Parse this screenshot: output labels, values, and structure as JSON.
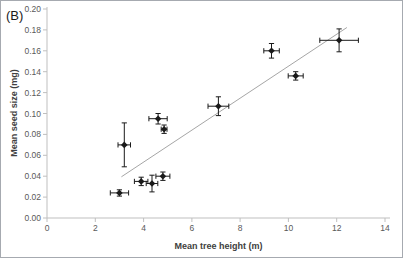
{
  "panel_label": "(B)",
  "chart_data": {
    "type": "scatter",
    "title": "",
    "xlabel": "Mean tree height (m)",
    "ylabel": "Mean seed size (mg)",
    "xlim": [
      0,
      14
    ],
    "ylim": [
      0,
      0.2
    ],
    "grid": false,
    "legend": "none",
    "marker": "filled-diamond",
    "xticks": [
      {
        "v": 0,
        "label": "0"
      },
      {
        "v": 2,
        "label": "2"
      },
      {
        "v": 4,
        "label": "4"
      },
      {
        "v": 6,
        "label": "6"
      },
      {
        "v": 8,
        "label": "8"
      },
      {
        "v": 10,
        "label": "10"
      },
      {
        "v": 12,
        "label": "12"
      },
      {
        "v": 14,
        "label": "14"
      }
    ],
    "yticks": [
      {
        "v": 0.0,
        "label": "0.00"
      },
      {
        "v": 0.02,
        "label": "0.02"
      },
      {
        "v": 0.04,
        "label": "0.04"
      },
      {
        "v": 0.06,
        "label": "0.06"
      },
      {
        "v": 0.08,
        "label": "0.08"
      },
      {
        "v": 0.1,
        "label": "0.10"
      },
      {
        "v": 0.12,
        "label": "0.12"
      },
      {
        "v": 0.14,
        "label": "0.14"
      },
      {
        "v": 0.16,
        "label": "0.16"
      },
      {
        "v": 0.18,
        "label": "0.18"
      },
      {
        "v": 0.2,
        "label": "0.20"
      }
    ],
    "points": [
      {
        "x": 3.0,
        "y": 0.024,
        "xerr": 0.38,
        "yerr": 0.003
      },
      {
        "x": 3.2,
        "y": 0.07,
        "xerr": 0.26,
        "yerr": 0.021
      },
      {
        "x": 3.9,
        "y": 0.035,
        "xerr": 0.28,
        "yerr": 0.004
      },
      {
        "x": 4.35,
        "y": 0.033,
        "xerr": 0.24,
        "yerr": 0.008
      },
      {
        "x": 4.6,
        "y": 0.095,
        "xerr": 0.38,
        "yerr": 0.005
      },
      {
        "x": 4.8,
        "y": 0.04,
        "xerr": 0.29,
        "yerr": 0.004
      },
      {
        "x": 4.85,
        "y": 0.085,
        "xerr": 0.12,
        "yerr": 0.004
      },
      {
        "x": 7.1,
        "y": 0.107,
        "xerr": 0.43,
        "yerr": 0.009
      },
      {
        "x": 9.3,
        "y": 0.16,
        "xerr": 0.32,
        "yerr": 0.007
      },
      {
        "x": 10.3,
        "y": 0.136,
        "xerr": 0.31,
        "yerr": 0.004
      },
      {
        "x": 12.1,
        "y": 0.17,
        "xerr": 0.8,
        "yerr": 0.011
      }
    ],
    "trendline": {
      "x_start": 3.08,
      "x_end": 12.42,
      "slope": 0.0153,
      "intercept": -0.0077
    },
    "colors": {
      "marker": "#1a1a1a",
      "error_bar": "#1a1a1a",
      "trend_line": "#a6a6a6",
      "axis_line": "#bfbfbf",
      "tick_label": "#595959",
      "axis_title": "#404040"
    }
  }
}
